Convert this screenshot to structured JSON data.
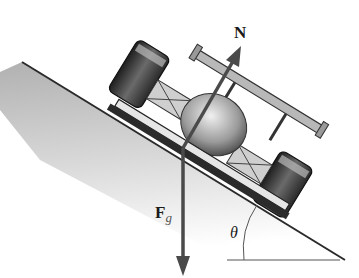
{
  "figure": {
    "labels": {
      "normal_force": "N",
      "gravity_force_main": "F",
      "gravity_force_sub": "g",
      "angle": "θ"
    },
    "colors": {
      "arrow": "#4a4a4a",
      "incline_line": "#2a2a2a",
      "ground_shade": "#bdbdbd",
      "car_dark": "#2b2b2b",
      "car_mid": "#8a8a8a",
      "car_light": "#d8d8d8"
    }
  }
}
